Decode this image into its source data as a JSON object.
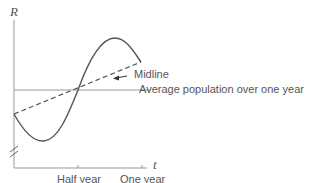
{
  "diagram": {
    "y_axis_label": "R",
    "x_axis_label": "t",
    "x_ticks": [
      "Half year",
      "One year"
    ],
    "annotations": {
      "midline": "Midline",
      "average": "Average population over one year"
    },
    "colors": {
      "curve": "#555555",
      "axis": "#888888",
      "text": "#555555"
    }
  }
}
